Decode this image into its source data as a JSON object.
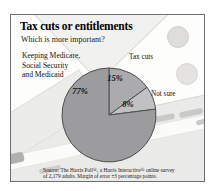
{
  "infographic": {
    "title": "Tax cuts or entitlements",
    "subtitle": "Which is more important?",
    "source": "Source: The Harris Poll®, a Harris Interactive® online survey\nof 2,179 adults. Margin of error ±3 percentage points."
  },
  "labels": {
    "entitlements": "Keeping Medicare,\nSocial Security\nand Medicaid",
    "tax_cuts": "Tax cuts",
    "not_sure": "Not sure"
  },
  "chart_data": {
    "type": "pie",
    "title": "Tax cuts or entitlements",
    "question": "Which is more important?",
    "units": "percent of adults surveyed",
    "start_angle_deg": 0,
    "direction": "clockwise",
    "outline_color": "#4e4e50",
    "slices": [
      {
        "label": "Tax cuts",
        "value": 15,
        "display": "15%",
        "color": "#ababad",
        "label_x": 56,
        "label_y": 13
      },
      {
        "label": "Not sure",
        "value": 8,
        "display": "8%",
        "color": "#c1c1c3",
        "label_x": 69,
        "label_y": 39
      },
      {
        "label": "Keeping Medicare, Social Security and Medicaid",
        "value": 77,
        "display": "77%",
        "color": "#9c9c9e",
        "label_x": 21,
        "label_y": 26
      }
    ]
  }
}
